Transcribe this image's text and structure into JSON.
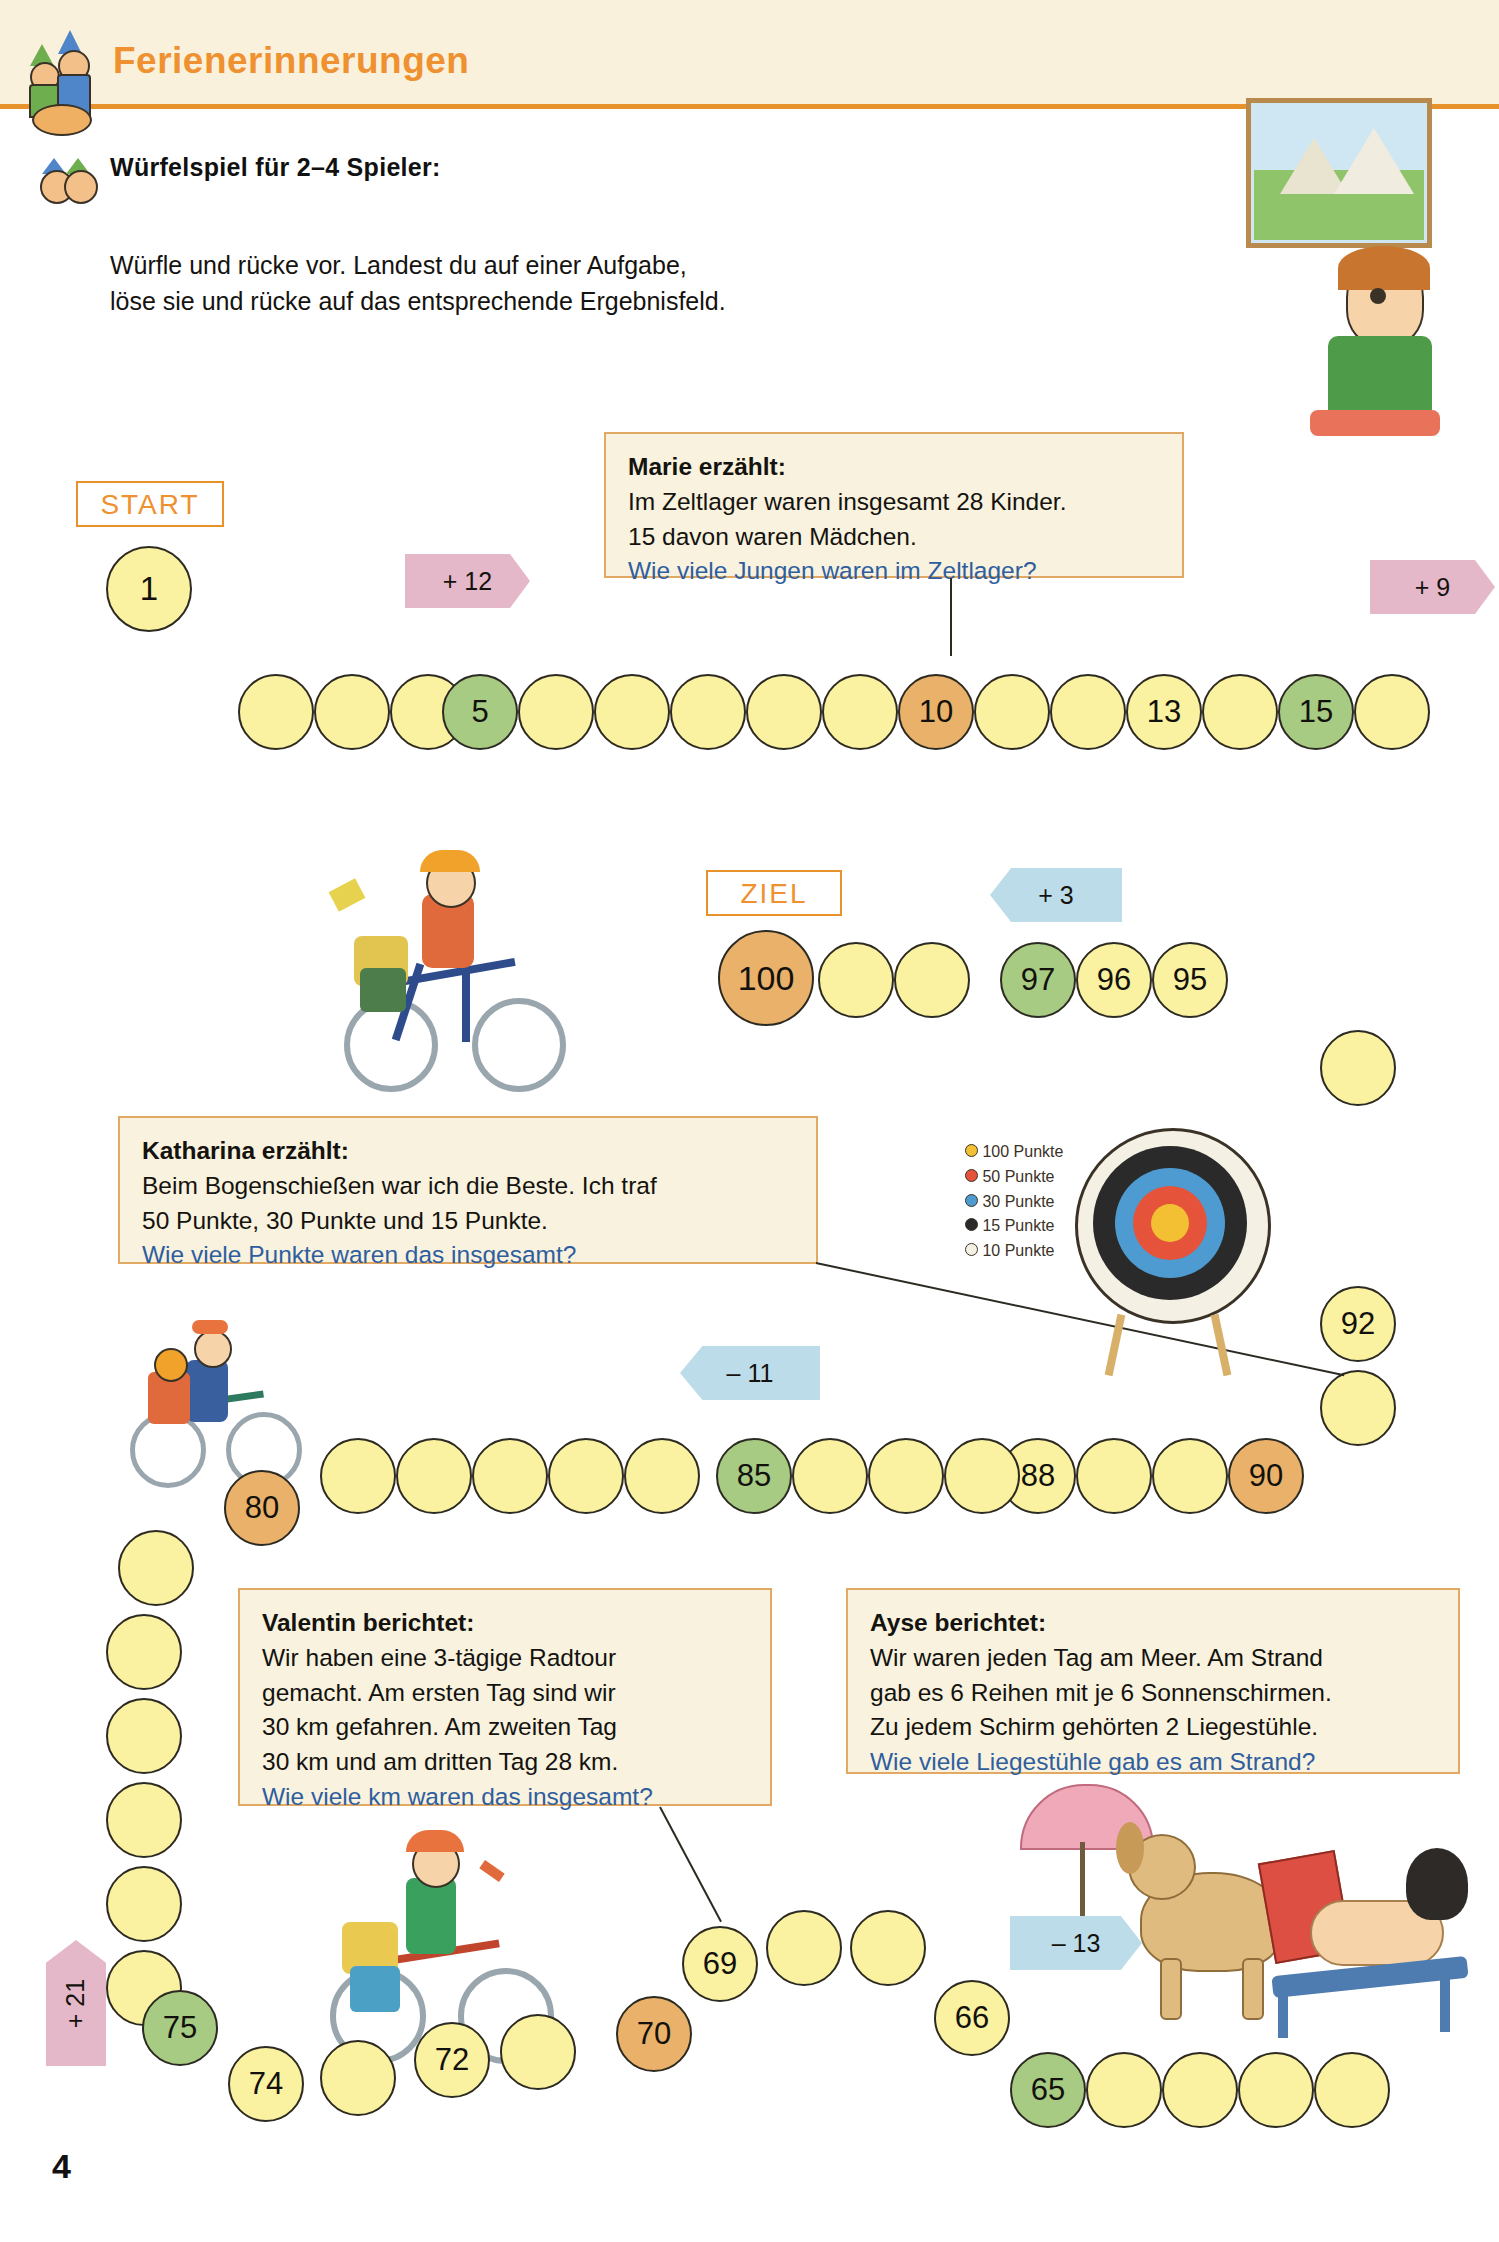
{
  "header": {
    "title": "Ferienerinnerungen",
    "icon": "two-children-icon"
  },
  "subheading": {
    "text": "Würfelspiel für 2–4 Spieler:",
    "icon": "two-faces-icon"
  },
  "intro": {
    "line1": "Würfle und rücke vor. Landest du auf einer Aufgabe,",
    "line2": "löse sie und rücke auf das entsprechende Ergebnisfeld."
  },
  "labels": {
    "start": "START",
    "ziel": "ZIEL"
  },
  "arrows": {
    "plus12": "+ 12",
    "plus9": "+ 9",
    "plus3": "+ 3",
    "minus11": "– 11",
    "minus13": "– 13",
    "plus21": "+ 21"
  },
  "bubbles": [
    {
      "id": "marie",
      "who": "Marie erzählt:",
      "lines": [
        "Im Zeltlager waren insgesamt 28 Kinder.",
        "15 davon waren Mädchen."
      ],
      "question": "Wie viele Jungen waren im Zeltlager?"
    },
    {
      "id": "katharina",
      "who": "Katharina erzählt:",
      "lines": [
        "Beim Bogenschießen war ich die Beste. Ich traf",
        "50 Punkte, 30 Punkte und 15 Punkte."
      ],
      "question": "Wie viele Punkte waren das insgesamt?"
    },
    {
      "id": "valentin",
      "who": "Valentin berichtet:",
      "lines": [
        "Wir haben eine 3-tägige Radtour",
        "gemacht. Am ersten Tag sind wir",
        "30 km gefahren. Am zweiten Tag",
        "30 km und am dritten Tag 28 km."
      ],
      "question": "Wie viele km waren das insgesamt?"
    },
    {
      "id": "ayse",
      "who": "Ayse berichtet:",
      "lines": [
        "Wir waren jeden Tag am Meer. Am Strand",
        "gab es 6 Reihen mit je 6 Sonnenschirmen.",
        "Zu jedem Schirm gehörten 2 Liegestühle."
      ],
      "question": "Wie viele Liegestühle gab es am Strand?"
    }
  ],
  "board": {
    "row1": [
      {
        "label": "1",
        "color": "yellow"
      },
      {
        "label": "",
        "color": "yellow"
      },
      {
        "label": "",
        "color": "yellow"
      },
      {
        "label": "",
        "color": "yellow"
      },
      {
        "label": "",
        "color": "yellow"
      },
      {
        "label": "5",
        "color": "green"
      },
      {
        "label": "",
        "color": "yellow"
      },
      {
        "label": "",
        "color": "yellow"
      },
      {
        "label": "",
        "color": "yellow"
      },
      {
        "label": "",
        "color": "yellow"
      },
      {
        "label": "10",
        "color": "orange"
      },
      {
        "label": "",
        "color": "yellow"
      },
      {
        "label": "",
        "color": "yellow"
      },
      {
        "label": "13",
        "color": "yellow"
      },
      {
        "label": "",
        "color": "yellow"
      },
      {
        "label": "15",
        "color": "green"
      }
    ],
    "row2": [
      {
        "label": "100",
        "color": "orange"
      },
      {
        "label": "",
        "color": "yellow"
      },
      {
        "label": "",
        "color": "yellow"
      },
      {
        "label": "97",
        "color": "green"
      },
      {
        "label": "96",
        "color": "yellow"
      },
      {
        "label": "95",
        "color": "yellow"
      }
    ],
    "row2_tail": [
      {
        "label": "",
        "color": "yellow"
      },
      {
        "label": "92",
        "color": "yellow"
      }
    ],
    "row3": [
      {
        "label": "80",
        "color": "orange"
      },
      {
        "label": "",
        "color": "yellow"
      },
      {
        "label": "",
        "color": "yellow"
      },
      {
        "label": "",
        "color": "yellow"
      },
      {
        "label": "",
        "color": "yellow"
      },
      {
        "label": "85",
        "color": "green"
      },
      {
        "label": "",
        "color": "yellow"
      },
      {
        "label": "",
        "color": "yellow"
      },
      {
        "label": "88",
        "color": "yellow"
      },
      {
        "label": "",
        "color": "yellow"
      },
      {
        "label": "90",
        "color": "orange"
      }
    ],
    "row3_down": [
      {
        "label": "",
        "color": "yellow"
      },
      {
        "label": "",
        "color": "yellow"
      },
      {
        "label": "",
        "color": "yellow"
      },
      {
        "label": "",
        "color": "yellow"
      },
      {
        "label": "",
        "color": "yellow"
      }
    ],
    "row4": [
      {
        "label": "75",
        "color": "green"
      },
      {
        "label": "74",
        "color": "yellow"
      },
      {
        "label": "72",
        "color": "yellow"
      },
      {
        "label": "70",
        "color": "orange"
      },
      {
        "label": "69",
        "color": "yellow"
      },
      {
        "label": "",
        "color": "yellow"
      },
      {
        "label": "",
        "color": "yellow"
      },
      {
        "label": "66",
        "color": "yellow"
      },
      {
        "label": "65",
        "color": "green"
      },
      {
        "label": "",
        "color": "yellow"
      },
      {
        "label": "",
        "color": "yellow"
      }
    ]
  },
  "illustrations": {
    "girl_picture": "girl-holding-picture-illustration",
    "cyclist_top": "boy-on-bicycle-illustration",
    "archery_target": "archery-target-illustration",
    "target_legend": [
      "100 Punkte",
      "50 Punkte",
      "30 Punkte",
      "15 Punkte",
      "10 Punkte"
    ],
    "tandem": "two-children-on-bicycle-illustration",
    "cyclist_bottom": "child-on-bicycle-with-luggage-illustration",
    "beach": "dog-and-woman-on-beach-chair-illustration"
  },
  "page_number": "4"
}
